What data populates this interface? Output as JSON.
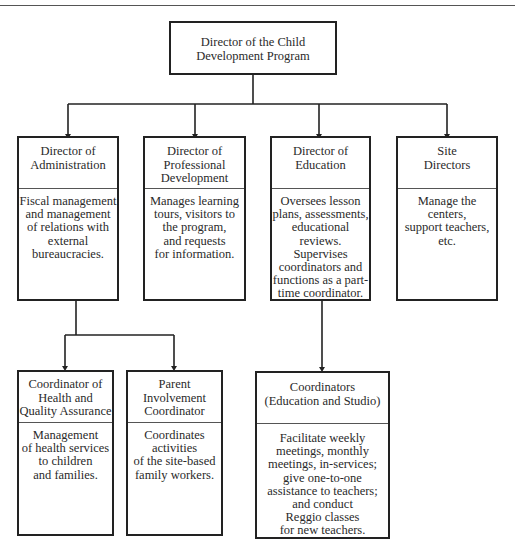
{
  "chart": {
    "root": {
      "title": "Director of the Child\nDevelopment Program"
    },
    "level2": [
      {
        "title": "Director of\nAdministration",
        "description": "Fiscal management\nand management\nof relations with\nexternal\nbureaucracies."
      },
      {
        "title": "Director of\nProfessional\nDevelopment",
        "description": "Manages learning\ntours, visitors to\nthe program,\nand requests\nfor information."
      },
      {
        "title": "Director of\nEducation",
        "description": "Oversees lesson\nplans, assessments,\neducational\nreviews. Supervises\ncoordinators and\nfunctions as a part-\ntime coordinator."
      },
      {
        "title": "Site\nDirectors",
        "description": "Manage the\ncenters,\nsupport teachers,\netc."
      }
    ],
    "level3": [
      {
        "reports_to": "Director of Administration",
        "title": "Coordinator of\nHealth and\nQuality Assurance",
        "description": "Management\nof health services\nto children\nand families."
      },
      {
        "reports_to": "Director of Administration",
        "title": "Parent\nInvolvement\nCoordinator",
        "description": "Coordinates\nactivities\nof the site-based\nfamily workers."
      },
      {
        "reports_to": "Director of Education",
        "title": "Coordinators\n(Education and Studio)",
        "description": "Facilitate weekly\nmeetings, monthly\nmeetings, in-services;\ngive one-to-one\nassistance to teachers;\nand conduct\nReggio classes\nfor new teachers."
      }
    ]
  },
  "colors": {
    "line": "#222222",
    "text": "#2a2a2a",
    "background": "#ffffff"
  }
}
